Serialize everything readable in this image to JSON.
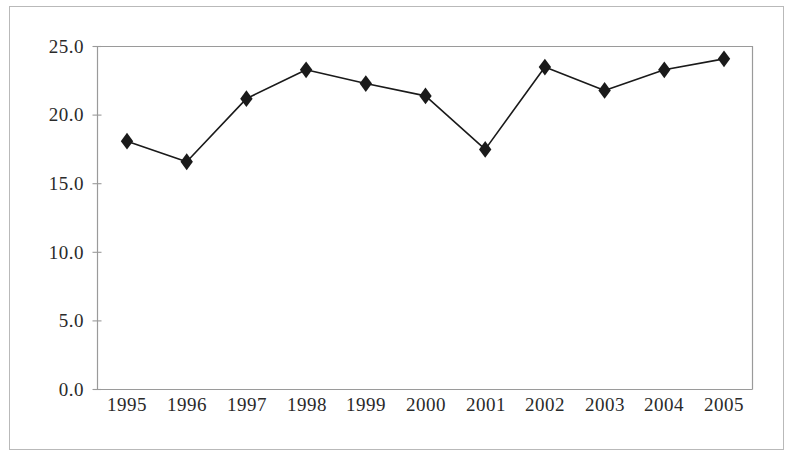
{
  "figure": {
    "background_color": "#ffffff",
    "frame_color": "#b9b9b9",
    "axis_color": "#9a9a9a",
    "series_color": "#1a1a1a"
  },
  "chart_data": {
    "type": "line",
    "title": "",
    "subtitle": "",
    "xlabel": "",
    "ylabel": "",
    "categories": [
      "1995",
      "1996",
      "1997",
      "1998",
      "1999",
      "2000",
      "2001",
      "2002",
      "2003",
      "2004",
      "2005"
    ],
    "values": [
      18.1,
      16.6,
      21.2,
      23.3,
      22.3,
      21.4,
      17.5,
      23.5,
      21.8,
      23.3,
      24.1
    ],
    "series": [
      {
        "name": "",
        "values": [
          18.1,
          16.6,
          21.2,
          23.3,
          22.3,
          21.4,
          17.5,
          23.5,
          21.8,
          23.3,
          24.1
        ]
      }
    ],
    "ylim": [
      0.0,
      25.0
    ],
    "yticks": [
      0.0,
      5.0,
      10.0,
      15.0,
      20.0,
      25.0
    ],
    "ytick_labels": [
      "0.0",
      "5.0",
      "10.0",
      "15.0",
      "20.0",
      "25.0"
    ],
    "xtick_labels": [
      "1995",
      "1996",
      "1997",
      "1998",
      "1999",
      "2000",
      "2001",
      "2002",
      "2003",
      "2004",
      "2005"
    ],
    "grid": false,
    "legend": false,
    "legend_position": "none",
    "marker": "diamond",
    "annotations": []
  },
  "axis_labels": {
    "y": [
      "25.0",
      "20.0",
      "15.0",
      "10.0",
      "5.0",
      "0.0"
    ],
    "x": [
      "1995",
      "1996",
      "1997",
      "1998",
      "1999",
      "2000",
      "2001",
      "2002",
      "2003",
      "2004",
      "2005"
    ]
  }
}
